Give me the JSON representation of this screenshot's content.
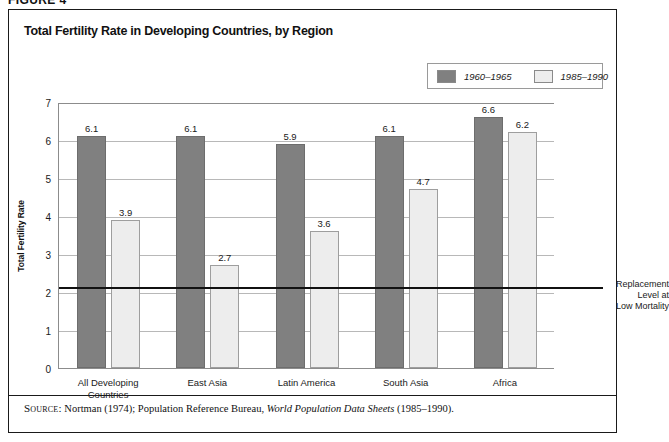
{
  "figure": {
    "number_label": "FIGURE 4"
  },
  "chart_title": "Total Fertility Rate in Developing Countries, by Region",
  "legend": {
    "position": "top-right",
    "items": [
      {
        "label": "1960–1965",
        "swatch": "dark-gray-swatch",
        "color": "#808080"
      },
      {
        "label": "1985–1990",
        "swatch": "light-gray-swatch",
        "color": "#ededed"
      }
    ]
  },
  "annotation": {
    "replacement_level": {
      "line1": "Replacement",
      "line2": "Level at",
      "line3": "Low Mortality",
      "value": 2.15
    }
  },
  "source": {
    "kicker": "Source:",
    "text_before": "Nortman (1974); Population Reference Bureau,",
    "italic_title": "World Population Data Sheets",
    "text_after": "(1985–1990)."
  },
  "chart_data": {
    "type": "bar",
    "title": "Total Fertility Rate in Developing Countries, by Region",
    "xlabel": "",
    "ylabel": "Total Fertility Rate",
    "ylim": [
      0,
      7
    ],
    "yticks": [
      0,
      1,
      2,
      3,
      4,
      5,
      6,
      7
    ],
    "ytick_labels": [
      "0",
      "1",
      "2",
      "3",
      "4",
      "5",
      "6",
      "7"
    ],
    "grid": true,
    "legend_position": "top-right",
    "categories": [
      "All Developing\nCountries",
      "East Asia",
      "Latin America",
      "South Asia",
      "Africa"
    ],
    "category_lines": [
      [
        "All Developing",
        "Countries"
      ],
      [
        "East Asia"
      ],
      [
        "Latin America"
      ],
      [
        "South Asia"
      ],
      [
        "Africa"
      ]
    ],
    "series": [
      {
        "name": "1960–1965",
        "color": "#808080",
        "values": [
          6.1,
          6.1,
          5.9,
          6.1,
          6.6
        ],
        "labels": [
          "6.1",
          "6.1",
          "5.9",
          "6.1",
          "6.6"
        ]
      },
      {
        "name": "1985–1990",
        "color": "#ededed",
        "values": [
          3.9,
          2.7,
          3.6,
          4.7,
          6.2
        ],
        "labels": [
          "3.9",
          "2.7",
          "3.6",
          "4.7",
          "6.2"
        ]
      }
    ],
    "reference_line": {
      "value": 2.15,
      "label": "Replacement Level at Low Mortality",
      "color": "#111111"
    }
  }
}
